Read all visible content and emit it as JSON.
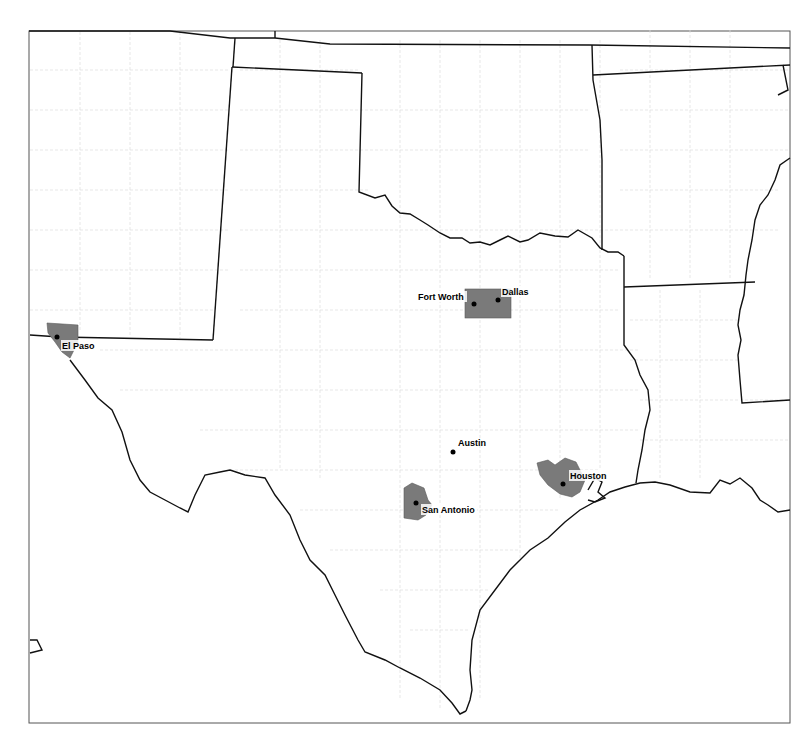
{
  "map": {
    "region": "Texas and surrounding states",
    "colors": {
      "background": "#ffffff",
      "state_border": "#111111",
      "county_border": "#d9d9d9",
      "metro_fill": "#7a7a7a",
      "city_point": "#000000",
      "frame": "#555555"
    },
    "cities": [
      {
        "name": "El Paso",
        "x": 57,
        "y": 337,
        "label_x": 62,
        "label_y": 348
      },
      {
        "name": "Fort Worth",
        "x": 474,
        "y": 304,
        "label_x": 418,
        "label_y": 299
      },
      {
        "name": "Dallas",
        "x": 498,
        "y": 300,
        "label_x": 502,
        "label_y": 294
      },
      {
        "name": "Austin",
        "x": 453,
        "y": 452,
        "label_x": 458,
        "label_y": 445
      },
      {
        "name": "San Antonio",
        "x": 416,
        "y": 503,
        "label_x": 422,
        "label_y": 512
      },
      {
        "name": "Houston",
        "x": 563,
        "y": 484,
        "label_x": 570,
        "label_y": 478
      }
    ]
  }
}
